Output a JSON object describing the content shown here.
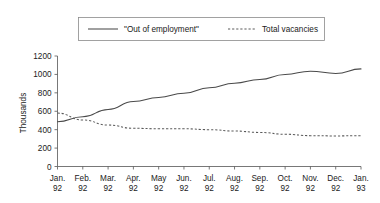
{
  "chart_data": {
    "type": "line",
    "title": "",
    "xlabel": "",
    "ylabel": "Thousands",
    "ylim": [
      0,
      1200
    ],
    "yticks": [
      0,
      200,
      400,
      600,
      800,
      1000,
      1200
    ],
    "ytick_labels": [
      "0",
      "200",
      "400",
      "600",
      "800",
      "1000",
      "1200"
    ],
    "grid": false,
    "legend_position": "top-center",
    "categories": [
      "Jan. 92",
      "Feb. 92",
      "Mar. 92",
      "Apr. 92",
      "May 92",
      "Jun. 92",
      "Jul. 92",
      "Aug. 92",
      "Sep. 92",
      "Oct. 92",
      "Nov. 92",
      "Dec. 92",
      "Jan. 93"
    ],
    "xtick_labels": [
      {
        "month": "Jan.",
        "year": "92"
      },
      {
        "month": "Feb.",
        "year": "92"
      },
      {
        "month": "Mar.",
        "year": "92"
      },
      {
        "month": "Apr.",
        "year": "92"
      },
      {
        "month": "May",
        "year": "92"
      },
      {
        "month": "Jun.",
        "year": "92"
      },
      {
        "month": "Jul.",
        "year": "92"
      },
      {
        "month": "Aug.",
        "year": "92"
      },
      {
        "month": "Sep.",
        "year": "92"
      },
      {
        "month": "Oct.",
        "year": "92"
      },
      {
        "month": "Nov.",
        "year": "92"
      },
      {
        "month": "Dec.",
        "year": "92"
      },
      {
        "month": "Jan.",
        "year": "93"
      }
    ],
    "series": [
      {
        "name": "\"Out of employment\"",
        "style": "solid",
        "color": "#4a4a4a",
        "values": [
          485,
          540,
          620,
          705,
          750,
          795,
          855,
          905,
          945,
          1000,
          1035,
          1010,
          1060
        ]
      },
      {
        "name": "Total vacancies",
        "style": "dashed",
        "color": "#5a5a5a",
        "values": [
          580,
          505,
          450,
          415,
          410,
          410,
          400,
          385,
          370,
          350,
          335,
          332,
          335
        ]
      }
    ]
  },
  "legend": {
    "items": [
      {
        "label": "\"Out of employment\"",
        "style": "solid"
      },
      {
        "label": "Total vacancies",
        "style": "dashed"
      }
    ]
  }
}
